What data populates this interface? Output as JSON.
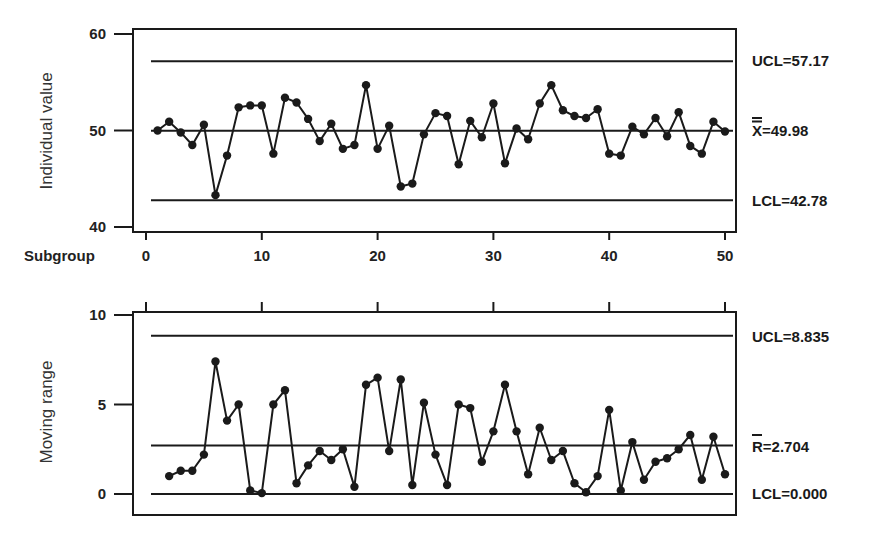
{
  "chart_data": [
    {
      "type": "line",
      "title": "",
      "xlabel": "Subgroup",
      "ylabel": "Individual value",
      "ylim": [
        39,
        61
      ],
      "xlim": [
        -1,
        51.5
      ],
      "yticks": [
        40,
        50,
        60
      ],
      "xticks": [
        0,
        10,
        20,
        30,
        40,
        50
      ],
      "grid": false,
      "control_lines": {
        "ucl": {
          "value": 57.17,
          "label": "UCL=57.17"
        },
        "center": {
          "value": 49.98,
          "label": "X=49.98",
          "symbol": "X double-bar"
        },
        "lcl": {
          "value": 42.78,
          "label": "LCL=42.78"
        }
      },
      "x": [
        1,
        2,
        3,
        4,
        5,
        6,
        7,
        8,
        9,
        10,
        11,
        12,
        13,
        14,
        15,
        16,
        17,
        18,
        19,
        20,
        21,
        22,
        23,
        24,
        25,
        26,
        27,
        28,
        29,
        30,
        31,
        32,
        33,
        34,
        35,
        36,
        37,
        38,
        39,
        40,
        41,
        42,
        43,
        44,
        45,
        46,
        47,
        48,
        49,
        50
      ],
      "series": [
        {
          "name": "Individual value",
          "values": [
            50.0,
            50.9,
            49.8,
            48.5,
            50.6,
            43.3,
            47.4,
            52.4,
            52.6,
            52.6,
            47.6,
            53.4,
            52.9,
            51.2,
            48.9,
            50.7,
            48.1,
            48.5,
            54.7,
            48.1,
            50.5,
            44.2,
            44.5,
            49.6,
            51.8,
            51.5,
            46.5,
            51.0,
            49.3,
            52.8,
            46.6,
            50.2,
            49.1,
            52.8,
            54.7,
            52.1,
            51.5,
            51.3,
            52.2,
            47.6,
            47.4,
            50.4,
            49.6,
            51.3,
            49.4,
            51.9,
            48.4,
            47.6,
            50.9,
            49.9
          ]
        }
      ]
    },
    {
      "type": "line",
      "title": "",
      "xlabel": "",
      "ylabel": "Moving range",
      "ylim": [
        -1.2,
        10
      ],
      "xlim": [
        -1,
        51.5
      ],
      "yticks": [
        0,
        5,
        10
      ],
      "xticks": [
        0,
        10,
        20,
        30,
        40,
        50
      ],
      "grid": false,
      "control_lines": {
        "ucl": {
          "value": 8.835,
          "label": "UCL=8.835"
        },
        "center": {
          "value": 2.704,
          "label": "R=2.704",
          "symbol": "R bar"
        },
        "lcl": {
          "value": 0.0,
          "label": "LCL=0.000"
        }
      },
      "x": [
        2,
        3,
        4,
        5,
        6,
        7,
        8,
        9,
        10,
        11,
        12,
        13,
        14,
        15,
        16,
        17,
        18,
        19,
        20,
        21,
        22,
        23,
        24,
        25,
        26,
        27,
        28,
        29,
        30,
        31,
        32,
        33,
        34,
        35,
        36,
        37,
        38,
        39,
        40,
        41,
        42,
        43,
        44,
        45,
        46,
        47,
        48,
        49,
        50
      ],
      "series": [
        {
          "name": "Moving range",
          "values": [
            1.0,
            1.3,
            1.3,
            2.2,
            7.4,
            4.1,
            5.0,
            0.2,
            0.05,
            5.0,
            5.8,
            0.6,
            1.6,
            2.4,
            1.9,
            2.5,
            0.4,
            6.1,
            6.5,
            2.4,
            6.4,
            0.5,
            5.1,
            2.2,
            0.5,
            5.0,
            4.8,
            1.8,
            3.5,
            6.1,
            3.5,
            1.1,
            3.7,
            1.9,
            2.4,
            0.6,
            0.1,
            1.0,
            4.7,
            0.2,
            2.9,
            0.8,
            1.8,
            2.0,
            2.5,
            3.3,
            0.8,
            3.2,
            1.1
          ]
        }
      ]
    }
  ],
  "labels": {
    "top_ylabel": "Individual value",
    "bottom_ylabel": "Moving range",
    "subgroup": "Subgroup",
    "top_ucl": "UCL=57.17",
    "top_center": "X=49.98",
    "top_lcl": "LCL=42.78",
    "bottom_ucl": "UCL=8.835",
    "bottom_center": "R=2.704",
    "bottom_lcl": "LCL=0.000",
    "xticks": [
      "0",
      "10",
      "20",
      "30",
      "40",
      "50"
    ],
    "top_yticks": [
      "40",
      "50",
      "60"
    ],
    "bottom_yticks": [
      "0",
      "5",
      "10"
    ]
  },
  "colors": {
    "ink": "#1a1a1a",
    "background": "#ffffff"
  }
}
